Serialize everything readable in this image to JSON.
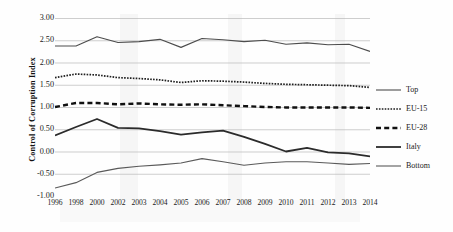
{
  "chart_data": {
    "type": "line",
    "title": "",
    "xlabel": "",
    "ylabel": "Control of Corruption Index",
    "categories": [
      "1996",
      "1998",
      "2000",
      "2002",
      "2003",
      "2004",
      "2005",
      "2006",
      "2007",
      "2008",
      "2009",
      "2010",
      "2011",
      "2012",
      "2013",
      "2014"
    ],
    "ylim": [
      -1.0,
      3.0
    ],
    "ytick_labels": [
      "3.00",
      "2.50",
      "2.00",
      "1.50",
      "1.00",
      "0.50",
      "0.00",
      "-0.50",
      "-1.00"
    ],
    "ytick_values": [
      3.0,
      2.5,
      2.0,
      1.5,
      1.0,
      0.5,
      0.0,
      -0.5,
      -1.0
    ],
    "grid": "horizontal",
    "legend_position": "right",
    "series": [
      {
        "name": "Top",
        "style": "solid-thin",
        "color": "#4d4d4d",
        "values": [
          2.37,
          2.37,
          2.58,
          2.45,
          2.47,
          2.52,
          2.34,
          2.54,
          2.51,
          2.47,
          2.5,
          2.41,
          2.44,
          2.4,
          2.41,
          2.25
        ]
      },
      {
        "name": "EU-15",
        "style": "dotted",
        "color": "#1f1f1f",
        "values": [
          1.66,
          1.74,
          1.72,
          1.66,
          1.64,
          1.61,
          1.55,
          1.59,
          1.58,
          1.56,
          1.53,
          1.51,
          1.5,
          1.49,
          1.48,
          1.44
        ]
      },
      {
        "name": "EU-28",
        "style": "dashed-bold",
        "color": "#111111",
        "values": [
          1.0,
          1.09,
          1.09,
          1.06,
          1.08,
          1.06,
          1.05,
          1.06,
          1.04,
          1.02,
          1.0,
          0.99,
          0.99,
          0.99,
          0.99,
          0.98
        ]
      },
      {
        "name": "Italy",
        "style": "solid-bold",
        "color": "#2b2b2b",
        "values": [
          0.36,
          0.55,
          0.73,
          0.53,
          0.52,
          0.46,
          0.38,
          0.43,
          0.47,
          0.33,
          0.17,
          0.0,
          0.08,
          -0.02,
          -0.04,
          -0.11
        ]
      },
      {
        "name": "Bottom",
        "style": "solid-thin",
        "color": "#5a5a5a",
        "values": [
          -0.82,
          -0.7,
          -0.47,
          -0.38,
          -0.33,
          -0.3,
          -0.26,
          -0.16,
          -0.23,
          -0.31,
          -0.26,
          -0.23,
          -0.23,
          -0.26,
          -0.29,
          -0.27
        ]
      }
    ]
  },
  "legend": {
    "items": [
      {
        "label": "Top"
      },
      {
        "label": "EU-15"
      },
      {
        "label": "EU-28"
      },
      {
        "label": "Italy"
      },
      {
        "label": "Bottom"
      }
    ]
  }
}
